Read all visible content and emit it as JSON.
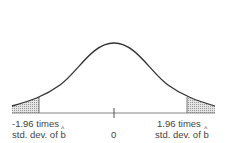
{
  "diagram": {
    "type": "normal-distribution-two-tailed",
    "center_label": "0",
    "left_label": {
      "line1": "-1.96 times",
      "line2_prefix": "std. dev. of ",
      "symbol": "b"
    },
    "right_label": {
      "line1": "1.96 times",
      "line2_prefix": "std. dev. of ",
      "symbol": "b"
    },
    "critical_value": 1.96,
    "colors": {
      "curve": "#333333",
      "axis": "#777777",
      "shade": "#c8c8c8"
    }
  }
}
